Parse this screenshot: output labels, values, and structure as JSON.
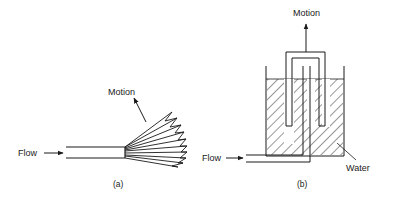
{
  "figure": {
    "panel_a": {
      "caption": "(a)",
      "labels": {
        "flow": "Flow",
        "motion": "Motion"
      }
    },
    "panel_b": {
      "caption": "(b)",
      "labels": {
        "flow": "Flow",
        "motion": "Motion",
        "water": "Water"
      }
    }
  },
  "colors": {
    "ink": "#1a1a1a",
    "background": "#ffffff"
  }
}
